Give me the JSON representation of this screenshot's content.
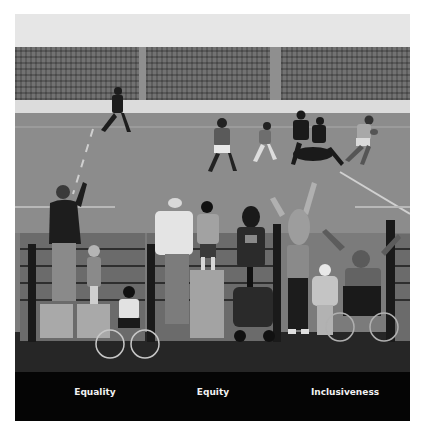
{
  "illustration": {
    "subject": "Rugby match watched by spectators behind a fence",
    "palette": {
      "sky": "#e6e6e6",
      "stands": "#727272",
      "pitch": "#8c8c8c",
      "ground": "#262626",
      "label_band": "#050505",
      "label_text": "#f2f2f2"
    }
  },
  "panels": [
    {
      "label": "Equality"
    },
    {
      "label": "Equity"
    },
    {
      "label": "Inclusiveness"
    }
  ]
}
